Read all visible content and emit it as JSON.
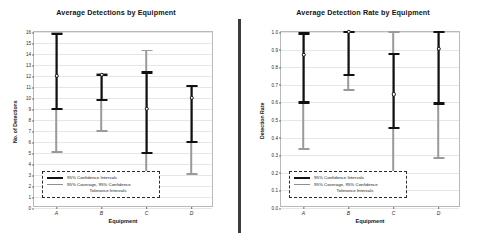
{
  "legend": {
    "ci_label": "95% Confidence Intervals",
    "tol_label_line1": "95% Coverage, 95% Confidence",
    "tol_label_line2": "Tolerance Intervals"
  },
  "colors": {
    "confidence": "#111111",
    "tolerance": "#9a9a9a",
    "grid": "#e6e6e6",
    "axis": "#b9b9b9",
    "divider": "#3b3b3b"
  },
  "chart_data": [
    {
      "type": "errorbar",
      "title": "Average Detections by Equipment",
      "xlabel": "Equipment",
      "ylabel": "No. of Detections",
      "categories": [
        "A",
        "B",
        "C",
        "D"
      ],
      "ylim": [
        0,
        16
      ],
      "yticks": [
        "0",
        "1",
        "2",
        "3",
        "4",
        "5",
        "6",
        "7",
        "8",
        "9",
        "10",
        "11",
        "12",
        "13",
        "14",
        "15",
        "16"
      ],
      "grid": true,
      "legend_position": "bottom-left",
      "series": [
        {
          "name": "Mean",
          "values": [
            12.0,
            12.1,
            9.0,
            10.0
          ]
        },
        {
          "name": "95% Confidence Intervals",
          "lower": [
            9.0,
            9.8,
            5.0,
            6.0
          ],
          "upper": [
            15.8,
            12.1,
            12.3,
            11.1
          ]
        },
        {
          "name": "95% Coverage, 95% Confidence Tolerance Intervals",
          "lower": [
            5.1,
            7.0,
            2.1,
            3.1
          ],
          "upper": [
            15.9,
            12.2,
            14.3,
            11.1
          ]
        }
      ]
    },
    {
      "type": "errorbar",
      "title": "Average Detection Rate by Equipment",
      "xlabel": "Equipment",
      "ylabel": "Detection Rate",
      "categories": [
        "A",
        "B",
        "C",
        "D"
      ],
      "ylim": [
        0.0,
        1.0
      ],
      "yticks": [
        "0.0",
        "0.1",
        "0.2",
        "0.3",
        "0.4",
        "0.5",
        "0.6",
        "0.7",
        "0.8",
        "0.9",
        "1.0"
      ],
      "grid": true,
      "legend_position": "bottom-left",
      "series": [
        {
          "name": "Mean",
          "values": [
            0.87,
            1.0,
            0.645,
            0.905
          ]
        },
        {
          "name": "95% Confidence Intervals",
          "lower": [
            0.6,
            0.755,
            0.455,
            0.595
          ],
          "upper": [
            0.99,
            1.0,
            0.875,
            1.0
          ]
        },
        {
          "name": "95% Coverage, 95% Confidence Tolerance Intervals",
          "lower": [
            0.335,
            0.67,
            0.145,
            0.285
          ],
          "upper": [
            0.99,
            1.0,
            1.0,
            1.0
          ]
        }
      ]
    }
  ]
}
